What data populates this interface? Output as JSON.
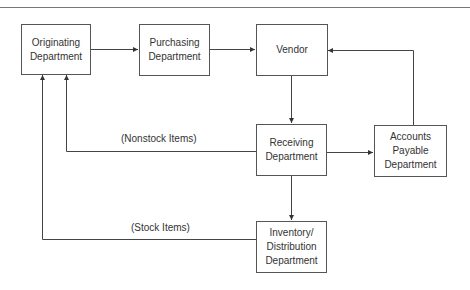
{
  "diagram": {
    "nodes": {
      "originating": {
        "line1": "Originating",
        "line2": "Department"
      },
      "purchasing": {
        "line1": "Purchasing",
        "line2": "Department"
      },
      "vendor": {
        "line1": "Vendor"
      },
      "receiving": {
        "line1": "Receiving",
        "line2": "Department"
      },
      "accounts_payable": {
        "line1": "Accounts",
        "line2": "Payable",
        "line3": "Department"
      },
      "inventory": {
        "line1": "Inventory/",
        "line2": "Distribution",
        "line3": "Department"
      }
    },
    "edge_labels": {
      "nonstock": "(Nonstock Items)",
      "stock": "(Stock Items)"
    },
    "edges": [
      {
        "from": "Originating Department",
        "to": "Purchasing Department"
      },
      {
        "from": "Purchasing Department",
        "to": "Vendor"
      },
      {
        "from": "Vendor",
        "to": "Receiving Department"
      },
      {
        "from": "Receiving Department",
        "to": "Accounts Payable Department"
      },
      {
        "from": "Accounts Payable Department",
        "to": "Vendor"
      },
      {
        "from": "Receiving Department",
        "to": "Inventory/Distribution Department"
      },
      {
        "from": "Receiving Department",
        "to": "Originating Department",
        "label": "(Nonstock Items)"
      },
      {
        "from": "Inventory/Distribution Department",
        "to": "Originating Department",
        "label": "(Stock Items)"
      }
    ]
  }
}
